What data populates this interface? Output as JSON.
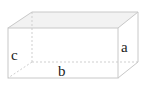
{
  "diagram": {
    "type": "rectangular-cuboid",
    "labels": {
      "height": "c",
      "length": "b",
      "depth": "a"
    },
    "colors": {
      "edge": "#c8c8c8",
      "hidden_edge": "#cfcfcf",
      "top_face": "#f2f2f2",
      "label": "#222222"
    }
  }
}
